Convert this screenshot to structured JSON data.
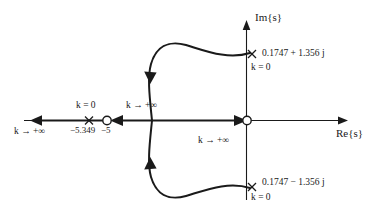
{
  "figure": {
    "type": "root-locus-diagram",
    "axes": {
      "imaginary_label": "Im{s}",
      "real_label": "Re{s}"
    },
    "poles": [
      {
        "name": "pole-upper",
        "value_label": "0.1747 + 1.356 j",
        "k_label": "k = 0",
        "real": 0.1747,
        "imag": 1.356
      },
      {
        "name": "pole-lower",
        "value_label": "0.1747 − 1.356 j",
        "k_label": "k = 0",
        "real": 0.1747,
        "imag": -1.356
      },
      {
        "name": "pole-real",
        "value_label": "−5.349",
        "k_label": "k = 0",
        "real": -5.349,
        "imag": 0
      }
    ],
    "zeros": [
      {
        "name": "zero-real",
        "value_label": "−5",
        "real": -5,
        "imag": 0
      },
      {
        "name": "zero-origin",
        "value_label": "",
        "real": 0,
        "imag": 0
      }
    ],
    "branch_labels": [
      {
        "name": "k-infinity-left",
        "text": "k → +∞"
      },
      {
        "name": "k-infinity-mid",
        "text": "k → +∞"
      },
      {
        "name": "k-infinity-origin",
        "text": "k → +∞"
      }
    ],
    "colors": {
      "stroke": "#1a1a1a",
      "background": "#ffffff"
    }
  }
}
